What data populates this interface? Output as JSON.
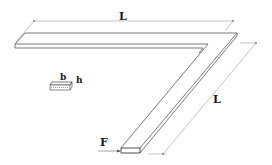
{
  "diagram": {
    "labels": {
      "top_length": "L",
      "diagonal_length": "L",
      "force": "F",
      "width": "b",
      "height": "h"
    },
    "colors": {
      "edge": "#555555",
      "dimension_line": "#9a9a9a",
      "text": "#1a1a1a",
      "background": "#ffffff"
    }
  }
}
